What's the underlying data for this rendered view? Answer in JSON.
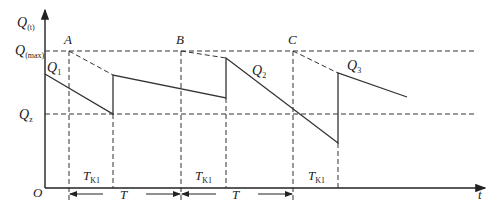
{
  "diagram": {
    "y_axis_label": "Q",
    "y_axis_sub": "(t)",
    "x_axis_label": "t",
    "origin_label": "O",
    "q_max_label": "Q",
    "q_max_sub": "(max)",
    "q_z_label": "Q",
    "q_z_sub": "z",
    "points": [
      "A",
      "B",
      "C"
    ],
    "curves": [
      {
        "label": "Q",
        "sub": "1"
      },
      {
        "label": "Q",
        "sub": "2"
      },
      {
        "label": "Q",
        "sub": "3"
      }
    ],
    "tk_labels": [
      {
        "label": "T",
        "sub": "K1"
      },
      {
        "label": "T",
        "sub": "K1"
      },
      {
        "label": "T",
        "sub": "K1"
      }
    ],
    "period_labels": [
      "T",
      "T"
    ],
    "colors": {
      "line": "#333333",
      "background": "#ffffff"
    }
  }
}
